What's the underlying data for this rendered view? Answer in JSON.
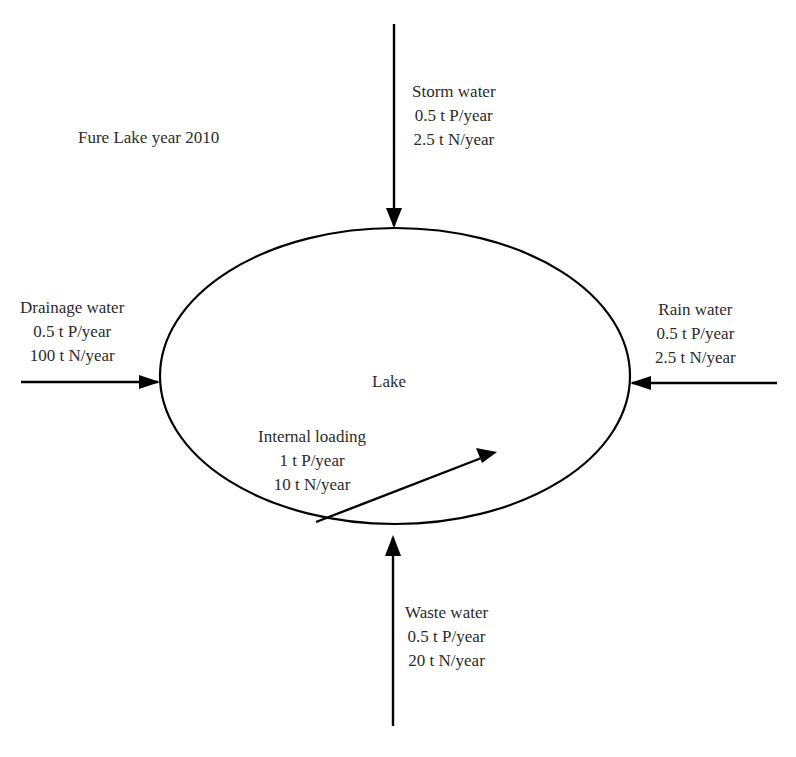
{
  "title": "Fure Lake year 2010",
  "lake": {
    "label": "Lake"
  },
  "flows": {
    "storm": {
      "name": "Storm water",
      "p": "0.5 t P/year",
      "n": "2.5 t N/year",
      "direction": "in-from-top"
    },
    "drainage": {
      "name": "Drainage water",
      "p": "0.5 t P/year",
      "n": "100 t N/year",
      "direction": "in-from-left"
    },
    "rain": {
      "name": "Rain water",
      "p": "0.5 t P/year",
      "n": "2.5 t N/year",
      "direction": "in-from-right"
    },
    "internal": {
      "name": "Internal loading",
      "p": "1 t P/year",
      "n": "10 t N/year",
      "direction": "from-bottom-edge-into-lake"
    },
    "waste": {
      "name": "Waste water",
      "p": "0.5 t P/year",
      "n": "20 t N/year",
      "direction": "in-from-bottom"
    }
  },
  "colors": {
    "stroke": "#000000",
    "text": "#2b2b2b",
    "background": "#ffffff"
  }
}
